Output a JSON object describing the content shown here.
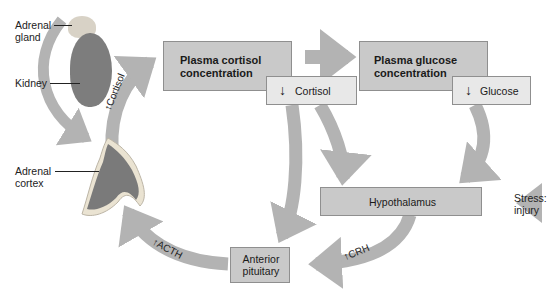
{
  "diagram": {
    "type": "hormone feedback loop (HPA axis)",
    "anatomy_labels": {
      "adrenal_gland": "Adrenal gland",
      "adrenal_gland_l1": "Adrenal",
      "adrenal_gland_l2": "gland",
      "kidney": "Kidney",
      "adrenal_cortex_l1": "Adrenal",
      "adrenal_cortex_l2": "cortex"
    },
    "nodes": {
      "plasma_cortisol": {
        "l1": "Plasma cortisol",
        "l2": "concentration",
        "change_icon": "down-arrow",
        "change_label": "Cortisol"
      },
      "plasma_glucose": {
        "l1": "Plasma glucose",
        "l2": "concentration",
        "change_icon": "down-arrow",
        "change_label": "Glucose"
      },
      "hypothalamus": {
        "label": "Hypothalamus"
      },
      "anterior_pituitary": {
        "l1": "Anterior",
        "l2": "pituitary"
      },
      "stimulus": {
        "l1": "Stress:",
        "l2": "injury"
      }
    },
    "arrows": {
      "cortisol": "Cortisol",
      "acth": "ACTH",
      "crh": "CRH"
    },
    "colors": {
      "arrow": "#b3b3b3",
      "box_dark": "#c9c9c9",
      "box_light": "#e8e8e8",
      "border": "#8f8f8f"
    }
  }
}
